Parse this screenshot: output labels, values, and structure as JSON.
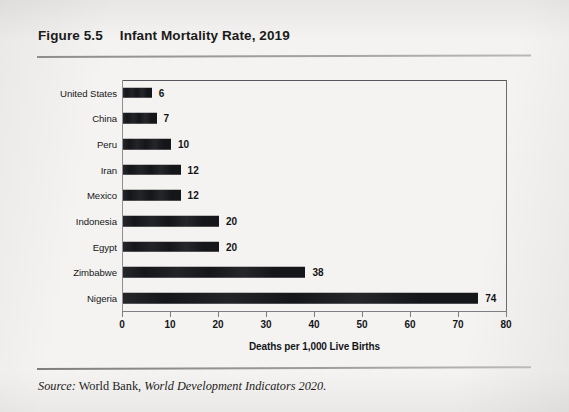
{
  "figure": {
    "number": "Figure 5.5",
    "title": "Infant Mortality Rate, 2019"
  },
  "source": {
    "label": "Source:",
    "publisher": "World Bank,",
    "work": "World Development Indicators 2020."
  },
  "colors": {
    "bar": "#15161a",
    "text": "#14161a",
    "frame": "#55585c",
    "page": "#f4f3f1"
  },
  "chart_data": {
    "type": "bar",
    "orientation": "horizontal",
    "title": "Infant Mortality Rate, 2019",
    "xlabel": "Deaths per 1,000 Live Births",
    "ylabel": "",
    "xlim": [
      0,
      80
    ],
    "xticks": [
      0,
      10,
      20,
      30,
      40,
      50,
      60,
      70,
      80
    ],
    "grid": false,
    "legend": false,
    "categories": [
      "United States",
      "China",
      "Peru",
      "Iran",
      "Mexico",
      "Indonesia",
      "Egypt",
      "Zimbabwe",
      "Nigeria"
    ],
    "values": [
      6,
      7,
      10,
      12,
      12,
      20,
      20,
      38,
      74
    ],
    "value_labels": [
      "6",
      "7",
      "10",
      "12",
      "12",
      "20",
      "20",
      "38",
      "74"
    ]
  }
}
